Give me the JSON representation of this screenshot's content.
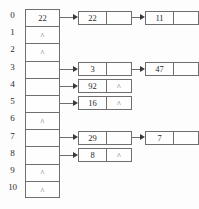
{
  "diagram": {
    "type": "hash-table-separate-chaining",
    "null_marker": "^",
    "index_labels": [
      "0",
      "1",
      "2",
      "3",
      "4",
      "5",
      "6",
      "7",
      "8",
      "9",
      "10"
    ],
    "buckets": [
      {
        "index": "0",
        "cell_text": "22",
        "has_chain": true,
        "chain": [
          {
            "data": "22",
            "next": ""
          },
          {
            "data": "11",
            "next": ""
          }
        ]
      },
      {
        "index": "1",
        "cell_text": "^",
        "has_chain": false,
        "chain": []
      },
      {
        "index": "2",
        "cell_text": "^",
        "has_chain": false,
        "chain": []
      },
      {
        "index": "3",
        "cell_text": "",
        "has_chain": true,
        "chain": [
          {
            "data": "3",
            "next": ""
          },
          {
            "data": "47",
            "next": ""
          }
        ]
      },
      {
        "index": "4",
        "cell_text": "",
        "has_chain": true,
        "chain": [
          {
            "data": "92",
            "next": "^"
          }
        ]
      },
      {
        "index": "5",
        "cell_text": "",
        "has_chain": true,
        "chain": [
          {
            "data": "16",
            "next": "^"
          }
        ]
      },
      {
        "index": "6",
        "cell_text": "^",
        "has_chain": false,
        "chain": []
      },
      {
        "index": "7",
        "cell_text": "",
        "has_chain": true,
        "chain": [
          {
            "data": "29",
            "next": ""
          },
          {
            "data": "7",
            "next": ""
          }
        ]
      },
      {
        "index": "8",
        "cell_text": "",
        "has_chain": true,
        "chain": [
          {
            "data": "8",
            "next": "^"
          }
        ]
      },
      {
        "index": "9",
        "cell_text": "^",
        "has_chain": false,
        "chain": []
      },
      {
        "index": "10",
        "cell_text": "^",
        "has_chain": false,
        "chain": []
      }
    ],
    "colors": {
      "stroke": "#6f6f6f",
      "arrow_head": "#3a3a3a",
      "text": "#2b2b2b",
      "background": "#fdfdfd"
    }
  }
}
